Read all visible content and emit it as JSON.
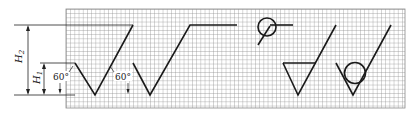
{
  "figure": {
    "dimensions": {
      "h1_label": "H",
      "h1_sub": "1",
      "h2_label": "H",
      "h2_sub": "2",
      "angle_left": "60°",
      "angle_right": "60°"
    },
    "symbols": [
      {
        "name": "basic-symbol",
        "description": "Basic roughness symbol (V with long arm)"
      },
      {
        "name": "extended-symbol",
        "description": "Symbol with horizontal extension line"
      },
      {
        "name": "all-around-symbol",
        "description": "Circle with tail and horizontal line"
      },
      {
        "name": "material-removal-symbol",
        "description": "Symbol with triangle (bar across)"
      },
      {
        "name": "no-material-removal-symbol",
        "description": "Symbol with inscribed circle"
      }
    ],
    "colors": {
      "grid_line": "#8a8a8a",
      "stroke": "#1a1a1a",
      "background": "#ffffff"
    }
  }
}
